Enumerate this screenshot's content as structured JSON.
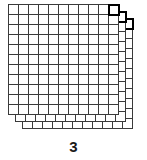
{
  "figure": {
    "caption": "3",
    "background_color": "#ffffff",
    "line_color": "#3a3a3a",
    "highlight_color": "#000000",
    "caption_color": "#1a1a1a"
  },
  "grid_stack": {
    "layer_count": 3,
    "columns": 11,
    "rows": 11,
    "cell_size_px": 10,
    "offset_x_px": 7,
    "offset_y_px": 7,
    "origin_x_px": 8,
    "origin_y_px": 4,
    "line_width_px": 1,
    "highlight_line_width_px": 2,
    "layers": [
      {
        "index": 1,
        "name": "back-layer",
        "origin_x": 22,
        "origin_y": 18,
        "highlight_cell_col": 10,
        "highlight_cell_row": 0
      },
      {
        "index": 2,
        "name": "middle-layer",
        "origin_x": 15,
        "origin_y": 11,
        "highlight_cell_col": 10,
        "highlight_cell_row": 0
      },
      {
        "index": 3,
        "name": "front-layer",
        "origin_x": 8,
        "origin_y": 4,
        "highlight_cell_col": 10,
        "highlight_cell_row": 0
      }
    ]
  },
  "chart_data": {
    "type": "table",
    "title": "3",
    "xlabel": "",
    "ylabel": "",
    "categories": [
      "layer 1",
      "layer 2",
      "layer 3"
    ],
    "values": [
      121,
      121,
      121
    ],
    "series": [
      {
        "name": "cells per layer",
        "values": [
          121,
          121,
          121
        ]
      }
    ],
    "annotations": [
      "3"
    ],
    "grid": true,
    "legend": false
  }
}
